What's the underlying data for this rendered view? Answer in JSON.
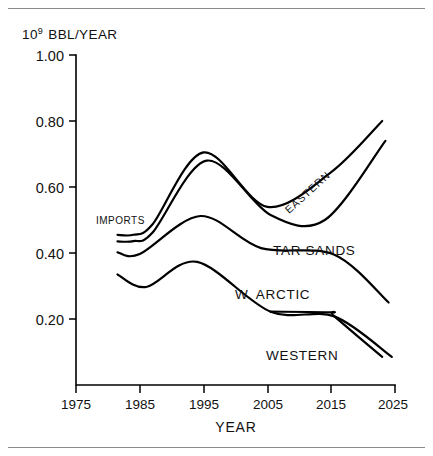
{
  "figure": {
    "y_axis_unit_mantissa": "10",
    "y_axis_unit_exponent": "9",
    "y_axis_unit_rest": "BBL/YEAR",
    "x_axis_title": "YEAR"
  },
  "chart_data": {
    "type": "line",
    "title": "",
    "subtitle": "",
    "xlabel": "YEAR",
    "ylabel": "10^9 BBL/YEAR",
    "xlim": [
      1975,
      2025
    ],
    "ylim": [
      0.0,
      1.0
    ],
    "xticks": [
      1975,
      1985,
      1995,
      2005,
      2015,
      2025
    ],
    "xtick_labels": [
      "1975",
      "1985",
      "1995",
      "2005",
      "2015",
      "2025"
    ],
    "yticks": [
      0.2,
      0.4,
      0.6,
      0.8,
      1.0
    ],
    "ytick_labels": [
      "0.20",
      "0.40",
      "0.60",
      "0.80",
      "1.00"
    ],
    "grid": false,
    "legend": "inline-annotations",
    "stacked": true,
    "annotations": [
      {
        "name": "imports-label",
        "text": "IMPORTS",
        "x": 1982.5,
        "y": 0.5,
        "rotation": 0
      },
      {
        "name": "eastern-label",
        "text": "EASTERN",
        "x": 2012.5,
        "y": 0.59,
        "rotation": -42
      },
      {
        "name": "tar-sands-label",
        "text": "TAR SANDS",
        "x": 2008.5,
        "y": 0.39,
        "rotation": 0
      },
      {
        "name": "w-arctic-label",
        "text": "W. ARCTIC",
        "x": 2003.5,
        "y": 0.27,
        "rotation": 0
      },
      {
        "name": "western-label",
        "text": "WESTERN",
        "x": 2007.5,
        "y": 0.12,
        "rotation": 0
      }
    ],
    "series": [
      {
        "name": "Total (top of IMPORTS band)",
        "label": "IMPORTS",
        "x": [
          1981.5,
          1984.0,
          1987.0,
          1995.0,
          2005.0,
          2015.0,
          2023.0
        ],
        "values": [
          0.455,
          0.455,
          0.487,
          0.705,
          0.54,
          0.645,
          0.8
        ]
      },
      {
        "name": "Top of EASTERN band",
        "label": "EASTERN",
        "x": [
          1981.5,
          1984.0,
          1987.0,
          1995.5,
          2005.5,
          2014.0,
          2023.5
        ],
        "values": [
          0.435,
          0.436,
          0.462,
          0.68,
          0.515,
          0.5,
          0.74
        ]
      },
      {
        "name": "Top of TAR SANDS band",
        "label": "TAR SANDS",
        "x": [
          1981.5,
          1985.0,
          1994.5,
          2004.0,
          2015.5,
          2024.0
        ],
        "values": [
          0.402,
          0.397,
          0.512,
          0.415,
          0.395,
          0.25
        ]
      },
      {
        "name": "Top of W. ARCTIC band",
        "label": "W. ARCTIC",
        "x": [
          1981.5,
          1986.0,
          1994.0,
          2005.5,
          2015.5,
          2024.5
        ],
        "values": [
          0.335,
          0.297,
          0.373,
          0.222,
          0.208,
          0.085
        ]
      },
      {
        "name": "WESTERN",
        "label": "WESTERN",
        "x": [
          2005.5,
          2015.0,
          2015.5,
          2023.0
        ],
        "values": [
          0.222,
          0.22,
          0.208,
          0.085
        ]
      }
    ]
  }
}
